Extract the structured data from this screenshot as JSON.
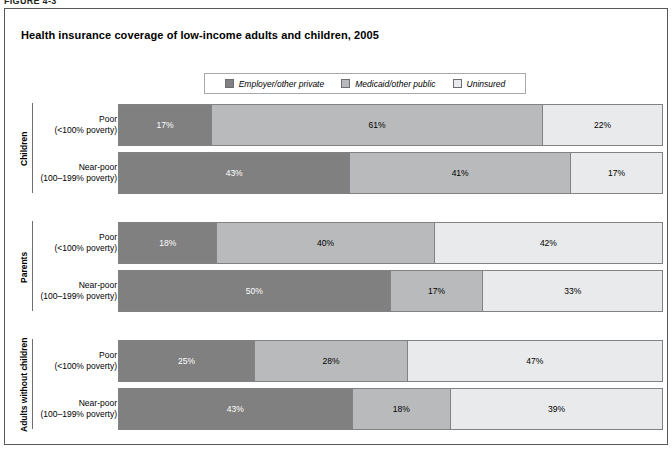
{
  "figure_label": "FIGURE 4-3",
  "title": "Health insurance coverage of low-income adults and children, 2005",
  "legend": {
    "items": [
      {
        "label": "Employer/other private",
        "color": "#808080"
      },
      {
        "label": "Medicaid/other public",
        "color": "#b9babc"
      },
      {
        "label": "Uninsured",
        "color": "#e9eaeb"
      }
    ]
  },
  "groups": [
    {
      "title": "Children",
      "rows": [
        {
          "line1": "Poor",
          "line2": "(<100% poverty)",
          "values": [
            17,
            61,
            22
          ],
          "labels": [
            "17%",
            "61%",
            "22%"
          ]
        },
        {
          "line1": "Near-poor",
          "line2": "(100–199% poverty)",
          "values": [
            43,
            41,
            17
          ],
          "labels": [
            "43%",
            "41%",
            "17%"
          ]
        }
      ]
    },
    {
      "title": "Parents",
      "rows": [
        {
          "line1": "Poor",
          "line2": "(<100% poverty)",
          "values": [
            18,
            40,
            42
          ],
          "labels": [
            "18%",
            "40%",
            "42%"
          ]
        },
        {
          "line1": "Near-poor",
          "line2": "(100–199% poverty)",
          "values": [
            50,
            17,
            33
          ],
          "labels": [
            "50%",
            "17%",
            "33%"
          ]
        }
      ]
    },
    {
      "title": "Adults without children",
      "rows": [
        {
          "line1": "Poor",
          "line2": "(<100% poverty)",
          "values": [
            25,
            28,
            47
          ],
          "labels": [
            "25%",
            "28%",
            "47%"
          ]
        },
        {
          "line1": "Near-poor",
          "line2": "(100–199% poverty)",
          "values": [
            43,
            18,
            39
          ],
          "labels": [
            "43%",
            "18%",
            "39%"
          ]
        }
      ]
    }
  ],
  "chart_data": {
    "type": "bar",
    "title": "Health insurance coverage of low-income adults and children, 2005",
    "orientation": "horizontal",
    "stacked": true,
    "stack_total": 100,
    "xlabel": "",
    "ylabel": "",
    "xlim": [
      0,
      100
    ],
    "grid": false,
    "legend_position": "top-center",
    "categories": [
      "Children — Poor (<100% poverty)",
      "Children — Near-poor (100–199% poverty)",
      "Parents — Poor (<100% poverty)",
      "Parents — Near-poor (100–199% poverty)",
      "Adults without children — Poor (<100% poverty)",
      "Adults without children — Near-poor (100–199% poverty)"
    ],
    "series": [
      {
        "name": "Employer/other private",
        "color": "#808080",
        "values": [
          17,
          43,
          18,
          50,
          25,
          43
        ]
      },
      {
        "name": "Medicaid/other public",
        "color": "#b9babc",
        "values": [
          61,
          41,
          40,
          17,
          28,
          18
        ]
      },
      {
        "name": "Uninsured",
        "color": "#e9eaeb",
        "values": [
          22,
          17,
          42,
          33,
          47,
          39
        ]
      }
    ]
  }
}
